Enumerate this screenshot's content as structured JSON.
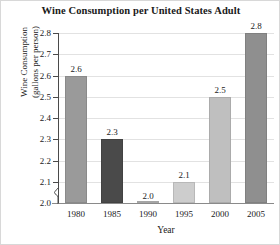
{
  "chart_data": {
    "type": "bar",
    "title": "Wine Consumption per United States Adult",
    "xlabel": "Year",
    "ylabel_line1": "Wine Consumption",
    "ylabel_line2": "(gallons per person)",
    "categories": [
      "1980",
      "1985",
      "1990",
      "1995",
      "2000",
      "2005"
    ],
    "values": [
      2.6,
      2.3,
      2.0,
      2.1,
      2.5,
      2.8
    ],
    "value_labels": [
      "2.6",
      "2.3",
      "2.0",
      "2.1",
      "2.5",
      "2.8"
    ],
    "bar_colors": [
      "#9a9a9a",
      "#4a4a4a",
      "#b8b8b8",
      "#cdcdcd",
      "#bfbfbf",
      "#8f8f8f"
    ],
    "ylim": [
      2.0,
      2.8
    ],
    "ytick_labels": [
      "2.0",
      "2.1",
      "2.2",
      "2.3",
      "2.4",
      "2.5",
      "2.6",
      "2.7",
      "2.8"
    ],
    "ytick_values": [
      2.0,
      2.1,
      2.2,
      2.3,
      2.4,
      2.5,
      2.6,
      2.7,
      2.8
    ],
    "grid": true,
    "legend": "none",
    "axis_break": true
  }
}
